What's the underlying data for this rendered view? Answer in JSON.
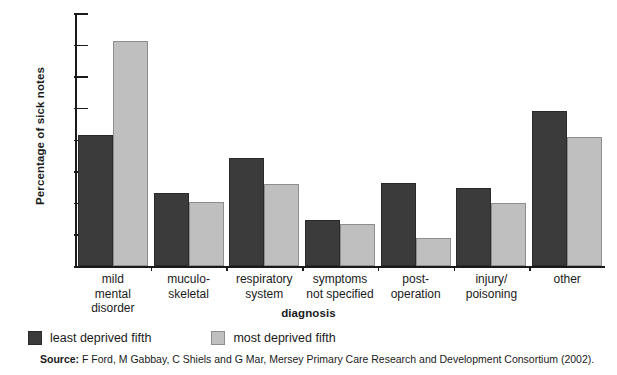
{
  "chart_data": {
    "type": "bar",
    "title": "",
    "xlabel": "diagnosis",
    "ylabel": "Percentage of sick notes",
    "ylim": [
      0,
      40
    ],
    "yticks": [
      0,
      5,
      10,
      15,
      20,
      25,
      30,
      35,
      40
    ],
    "ytick_labels": [
      "0",
      "5",
      "10",
      "15",
      "20",
      "25",
      "30",
      "35",
      "40"
    ],
    "grid": false,
    "legend_position": "below-axes-left",
    "categories": [
      "mild mental disorder",
      "muculo-skeletal",
      "respiratory system",
      "symptoms not specified",
      "post-operation",
      "injury/ poisoning",
      "other"
    ],
    "category_label_lines": [
      [
        "mild",
        "mental",
        "disorder"
      ],
      [
        "muculo-",
        "skeletal"
      ],
      [
        "respiratory",
        "system"
      ],
      [
        "symptoms",
        "not specified"
      ],
      [
        "post-",
        "operation"
      ],
      [
        "injury/",
        "poisoning"
      ],
      [
        "other"
      ]
    ],
    "series": [
      {
        "name": "least deprived fifth",
        "color": "#3b3b3b",
        "values": [
          20.7,
          11.5,
          17.0,
          7.3,
          13.1,
          12.4,
          24.5
        ]
      },
      {
        "name": "most deprived fifth",
        "color": "#bfbfbf",
        "values": [
          35.6,
          10.2,
          13.0,
          6.6,
          4.4,
          9.9,
          20.4
        ]
      }
    ]
  },
  "legend": {
    "items": [
      {
        "label": "least deprived fifth",
        "swatch": "dark"
      },
      {
        "label": "most deprived fifth",
        "swatch": "light"
      }
    ]
  },
  "source": {
    "prefix": "Source:",
    "text": " F Ford, M Gabbay, C Shiels and G Mar, Mersey Primary Care Research and Development Consortium (2002)."
  }
}
